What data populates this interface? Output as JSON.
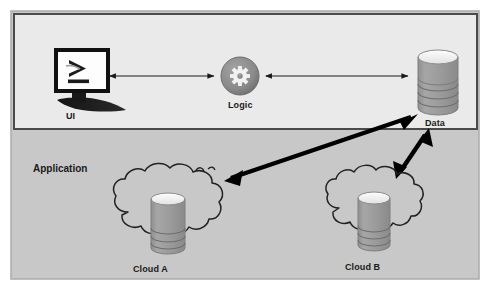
{
  "diagram": {
    "type": "architecture-diagram",
    "canvas": {
      "width": 491,
      "height": 290
    },
    "colors": {
      "page_background": "#ffffff",
      "outer_frame_fill": "#c9c9c9",
      "outer_frame_stroke": "#b0b0b0",
      "application_box_fill": "#e9e9e9",
      "application_box_stroke": "#4a4a4a",
      "cylinder_body": "#9a9a9a",
      "cylinder_top": "#f4f4f4",
      "gear_circle": "#8c8c8c",
      "gear_glyph": "#f2f2f2",
      "monitor_frame": "#111111",
      "monitor_screen": "#fcfcfc",
      "thin_arrow": "#1a1a1a",
      "thick_arrow": "#000000",
      "cloud_stroke": "#222222",
      "label_text": "#1a1a1a"
    },
    "zones": [
      {
        "id": "application",
        "label": "Application",
        "label_position": {
          "x": 33,
          "y": 163
        }
      }
    ],
    "nodes": [
      {
        "id": "ui",
        "label": "UI",
        "icon": "monitor-terminal-icon",
        "glyph": ">_",
        "label_position": {
          "x": 66,
          "y": 111
        }
      },
      {
        "id": "logic",
        "label": "Logic",
        "icon": "gear-icon",
        "label_position": {
          "x": 232,
          "y": 103
        }
      },
      {
        "id": "data",
        "label": "Data",
        "icon": "database-cylinder-icon",
        "label_position": {
          "x": 425,
          "y": 120
        }
      },
      {
        "id": "cloud-a",
        "label": "Cloud A",
        "icon": "cloud-database-icon",
        "label_position": {
          "x": 133,
          "y": 266
        }
      },
      {
        "id": "cloud-b",
        "label": "Cloud B",
        "icon": "cloud-database-icon",
        "label_position": {
          "x": 345,
          "y": 264
        }
      }
    ],
    "connections": [
      {
        "id": "ui-logic",
        "from": "ui",
        "to": "logic",
        "style": "thin",
        "arrowheads": "both"
      },
      {
        "id": "logic-data",
        "from": "logic",
        "to": "data",
        "style": "thin",
        "arrowheads": "both"
      },
      {
        "id": "data-cloud-a",
        "from": "data",
        "to": "cloud-a",
        "style": "thick",
        "arrowheads": "both"
      },
      {
        "id": "data-cloud-b",
        "from": "data",
        "to": "cloud-b",
        "style": "thick",
        "arrowheads": "both"
      }
    ]
  }
}
